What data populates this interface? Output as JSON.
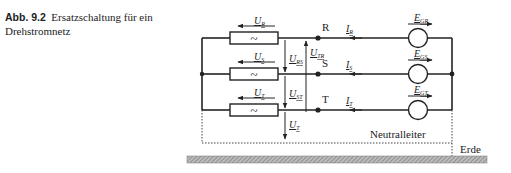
{
  "caption": {
    "number": "Abb. 9.2",
    "text": "Ersatzschaltung für ein Drehstromnetz"
  },
  "diagram": {
    "phases": [
      {
        "node": "R",
        "voltage_label": "U",
        "voltage_sub": "R",
        "current_label": "I",
        "current_sub": "R",
        "source_label": "E",
        "source_sub": "GR"
      },
      {
        "node": "S",
        "voltage_label": "U",
        "voltage_sub": "S",
        "current_label": "I",
        "current_sub": "S",
        "source_label": "E",
        "source_sub": "GS"
      },
      {
        "node": "T",
        "voltage_label": "U",
        "voltage_sub": "T",
        "current_label": "I",
        "current_sub": "T",
        "source_label": "E",
        "source_sub": "GT"
      }
    ],
    "line_voltages": [
      {
        "label": "U",
        "sub": "RS"
      },
      {
        "label": "U",
        "sub": "ST"
      },
      {
        "label": "U",
        "sub": "TR"
      },
      {
        "label": "U",
        "sub": "T"
      }
    ],
    "impedance_symbol": "~",
    "neutral_label": "Neutralleiter",
    "ground_label": "Erde"
  }
}
